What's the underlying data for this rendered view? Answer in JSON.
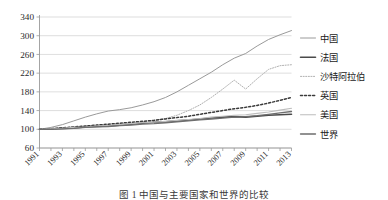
{
  "chart_data": {
    "type": "line",
    "title": "",
    "xlabel": "",
    "ylabel": "",
    "ylim": [
      60,
      340
    ],
    "ytick_values": [
      60,
      100,
      140,
      180,
      220,
      260,
      300,
      340
    ],
    "ytick_labels": [
      "60",
      "100",
      "140",
      "180",
      "220",
      "260",
      "300",
      "340"
    ],
    "grid": true,
    "legend_position": "right",
    "x": [
      1991,
      1992,
      1993,
      1994,
      1995,
      1996,
      1997,
      1998,
      1999,
      2000,
      2001,
      2002,
      2003,
      2004,
      2005,
      2006,
      2007,
      2008,
      2009,
      2010,
      2011,
      2012,
      2013
    ],
    "xtick_labels": [
      "1991",
      "1993",
      "1995",
      "1997",
      "1999",
      "2001",
      "2003",
      "2005",
      "2007",
      "2009",
      "2011",
      "2013"
    ],
    "xtick_values": [
      1991,
      1993,
      1995,
      1997,
      1999,
      2001,
      2003,
      2005,
      2007,
      2009,
      2011,
      2013
    ],
    "series": [
      {
        "name": "中国",
        "color": "#9a9a9a",
        "style": "solid",
        "width": 1.0,
        "values": [
          100,
          104,
          110,
          118,
          126,
          133,
          139,
          142,
          146,
          152,
          159,
          168,
          180,
          194,
          208,
          222,
          238,
          252,
          262,
          278,
          292,
          302,
          311
        ]
      },
      {
        "name": "法国",
        "color": "#4a4a4a",
        "style": "solid",
        "width": 1.6,
        "values": [
          100,
          101,
          102,
          103,
          105,
          106,
          107,
          109,
          111,
          113,
          115,
          116,
          118,
          120,
          122,
          124,
          126,
          127,
          126,
          128,
          130,
          131,
          132
        ]
      },
      {
        "name": "沙特阿拉伯",
        "color": "#b0b0b0",
        "style": "dotted-fine",
        "width": 1.0,
        "values": [
          100,
          101,
          103,
          105,
          107,
          109,
          110,
          112,
          113,
          116,
          119,
          123,
          130,
          140,
          152,
          168,
          186,
          205,
          186,
          208,
          228,
          236,
          238
        ]
      },
      {
        "name": "英国",
        "color": "#3a3a3a",
        "style": "dotted-bold",
        "width": 1.5,
        "values": [
          100,
          101,
          103,
          105,
          107,
          109,
          111,
          113,
          115,
          117,
          119,
          122,
          125,
          128,
          132,
          136,
          140,
          144,
          147,
          151,
          156,
          162,
          168
        ]
      },
      {
        "name": "美国",
        "color": "#bdbdbd",
        "style": "solid",
        "width": 1.1,
        "values": [
          100,
          101,
          102,
          104,
          105,
          107,
          108,
          110,
          112,
          114,
          115,
          117,
          119,
          121,
          123,
          126,
          128,
          130,
          131,
          134,
          137,
          141,
          145
        ]
      },
      {
        "name": "世界",
        "color": "#6e6e6e",
        "style": "solid",
        "width": 1.3,
        "values": [
          100,
          100,
          101,
          102,
          104,
          105,
          106,
          108,
          109,
          111,
          112,
          114,
          116,
          118,
          120,
          122,
          124,
          126,
          127,
          129,
          132,
          135,
          138
        ]
      }
    ]
  },
  "legend": {
    "items": [
      {
        "label": "中国"
      },
      {
        "label": "法国"
      },
      {
        "label": "沙特阿拉伯"
      },
      {
        "label": "英国"
      },
      {
        "label": "美国"
      },
      {
        "label": "世界"
      }
    ]
  },
  "caption": {
    "text": "图 1  中国与主要国家和世界的比较"
  }
}
